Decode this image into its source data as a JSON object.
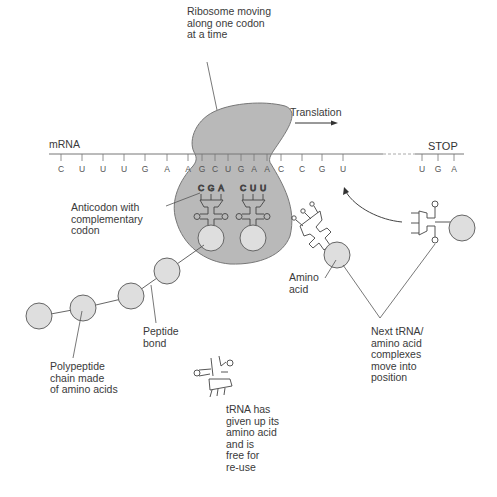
{
  "diagram": {
    "colors": {
      "ribosome_fill": "#b9b9b9",
      "amino_acid_fill": "#dedede",
      "line": "#555555",
      "text": "#3a3a3a"
    },
    "labels": {
      "ribosome": "Ribosome moving\nalong one codon\nat a time",
      "translation": "Translation",
      "mrna": "mRNA",
      "stop": "STOP",
      "anticodon": "Anticodon with\ncomplementary\ncodon",
      "amino_acid": "Amino\nacid",
      "peptide_bond": "Peptide\nbond",
      "polypeptide": "Polypeptide\nchain made\nof amino acids",
      "next_trna": "Next tRNA/\namino acid\ncomplexes\nmove into\nposition",
      "free_trna": "tRNA has\ngiven up its\namino acid\nand is\nfree for\nre-use"
    },
    "mrna_sequence": [
      "C",
      "U",
      "U",
      "U",
      "G",
      "A",
      "A",
      "G",
      "C",
      "U",
      "G",
      "A",
      "A",
      "C",
      "C",
      "G",
      "U"
    ],
    "stop_codon": [
      "U",
      "G",
      "A"
    ],
    "anticodons": [
      {
        "bases": [
          "C",
          "G",
          "A"
        ]
      },
      {
        "bases": [
          "C",
          "U",
          "U"
        ]
      }
    ],
    "incoming_trna_anticodon": [
      "C",
      "G",
      "C"
    ]
  }
}
